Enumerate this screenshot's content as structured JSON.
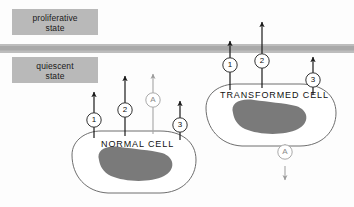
{
  "figure": {
    "width": 354,
    "height": 207,
    "background": "#fdfdfd"
  },
  "zones": {
    "proliferative": {
      "label_line1": "proliferative",
      "label_line2": "state",
      "box_color": "#b9b9b9"
    },
    "quiescent": {
      "label_line1": "quiescent",
      "label_line2": "state",
      "box_color": "#b9b9b9"
    },
    "threshold_band": {
      "name": "threshold-band",
      "color": "#b4b4b4",
      "y": 44,
      "height": 9
    }
  },
  "cells": [
    {
      "id": "normal-cell",
      "name": "NORMAL CELL",
      "outline_color": "#666666",
      "nucleus_color": "#777777"
    },
    {
      "id": "transformed-cell",
      "name": "TRANSFORMED CELL",
      "outline_color": "#666666",
      "nucleus_color": "#777777"
    }
  ],
  "markers": {
    "normal_cell": [
      {
        "id": "normal-marker-1",
        "label": "1",
        "style": "dark"
      },
      {
        "id": "normal-marker-2",
        "label": "2",
        "style": "dark"
      },
      {
        "id": "normal-marker-a",
        "label": "A",
        "style": "faint"
      },
      {
        "id": "normal-marker-3",
        "label": "3",
        "style": "dark"
      }
    ],
    "transformed_cell": [
      {
        "id": "transformed-marker-1",
        "label": "1",
        "style": "dark"
      },
      {
        "id": "transformed-marker-2",
        "label": "2",
        "style": "dark"
      },
      {
        "id": "transformed-marker-3",
        "label": "3",
        "style": "dark"
      },
      {
        "id": "transformed-marker-a",
        "label": "A",
        "style": "faint"
      }
    ]
  },
  "colors": {
    "arrow_dark": "#1a1a1a",
    "arrow_faint": "#9a9a9a",
    "circle_stroke_dark": "#333333",
    "circle_stroke_faint": "#a8a8a8",
    "text": "#111111"
  }
}
